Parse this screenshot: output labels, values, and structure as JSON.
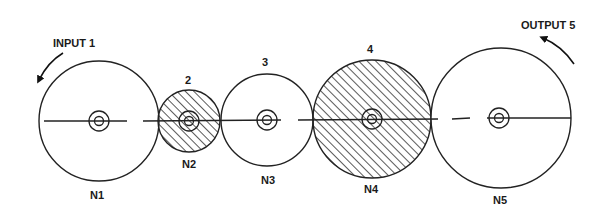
{
  "diagram": {
    "width": 608,
    "height": 217,
    "colors": {
      "stroke": "#222222",
      "background": "#ffffff",
      "hatch": "#222222"
    },
    "input": {
      "label": "INPUT 1",
      "label_x": 53,
      "label_y": 46
    },
    "output": {
      "label": "OUTPUT 5",
      "label_x": 521,
      "label_y": 29
    },
    "gears": [
      {
        "id": "1",
        "cx": 99,
        "cy": 121,
        "r": 60,
        "hatched": false,
        "top_label": "",
        "bottom_label": "N1",
        "top_y": 0,
        "bottom_y": 199
      },
      {
        "id": "2",
        "cx": 189,
        "cy": 121,
        "r": 31,
        "hatched": true,
        "top_label": "2",
        "bottom_label": "N2",
        "top_y": 84,
        "bottom_y": 167
      },
      {
        "id": "3",
        "cx": 267,
        "cy": 120,
        "r": 46,
        "hatched": false,
        "top_label": "3",
        "bottom_label": "N3",
        "top_y": 65,
        "bottom_y": 184
      },
      {
        "id": "4",
        "cx": 372,
        "cy": 119,
        "r": 59,
        "hatched": true,
        "top_label": "4",
        "bottom_label": "N4",
        "top_y": 53,
        "bottom_y": 193
      },
      {
        "id": "5",
        "cx": 501,
        "cy": 118,
        "r": 70,
        "hatched": false,
        "top_label": "",
        "bottom_label": "N5",
        "top_y": 0,
        "bottom_y": 204
      }
    ],
    "labels": {
      "input": "INPUT 1",
      "output": "OUTPUT 5",
      "g2_top": "2",
      "g3_top": "3",
      "g4_top": "4",
      "n1": "N1",
      "n2": "N2",
      "n3": "N3",
      "n4": "N4",
      "n5": "N5"
    }
  }
}
